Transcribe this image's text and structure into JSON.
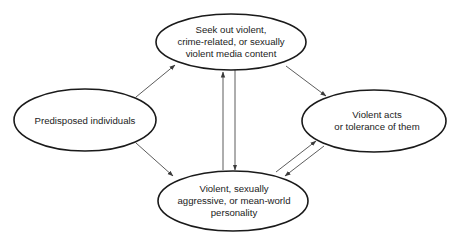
{
  "diagram": {
    "type": "flow",
    "colors": {
      "background": "#ffffff",
      "node_stroke": "#1a1a1a",
      "edge_stroke": "#4a4a4a",
      "text": "#222222"
    },
    "nodes": [
      {
        "id": "predisposed",
        "lines": [
          "Predisposed individuals"
        ]
      },
      {
        "id": "seek_media",
        "lines": [
          "Seek out violent,",
          "crime-related, or sexually",
          "violent media content"
        ]
      },
      {
        "id": "personality",
        "lines": [
          "Violent, sexually",
          "aggressive, or mean-world",
          "personality"
        ]
      },
      {
        "id": "violent_acts",
        "lines": [
          "Violent acts",
          "or tolerance of them"
        ]
      }
    ],
    "edges": [
      {
        "from": "predisposed",
        "to": "seek_media"
      },
      {
        "from": "predisposed",
        "to": "personality"
      },
      {
        "from": "seek_media",
        "to": "violent_acts"
      },
      {
        "from": "seek_media",
        "to": "personality"
      },
      {
        "from": "personality",
        "to": "seek_media"
      },
      {
        "from": "personality",
        "to": "violent_acts"
      },
      {
        "from": "violent_acts",
        "to": "personality"
      }
    ]
  }
}
